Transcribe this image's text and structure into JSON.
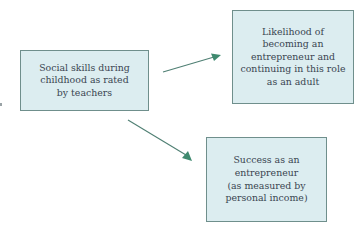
{
  "diagram": {
    "type": "causal-flow",
    "nodes": [
      {
        "id": "cause",
        "label": "Social skills during\nchildhood as rated\nby teachers"
      },
      {
        "id": "outcome-likelihood",
        "label": "Likelihood of\nbecoming an\nentrepreneur and\ncontinuing in this role\nas an adult"
      },
      {
        "id": "outcome-success",
        "label": "Success as an\nentrepreneur\n(as measured by\npersonal income)"
      }
    ],
    "edges": [
      {
        "from": "cause",
        "to": "outcome-likelihood"
      },
      {
        "from": "cause",
        "to": "outcome-success"
      }
    ],
    "colors": {
      "node_fill": "#dcedf0",
      "node_border": "#6f8f8c",
      "text": "#3a4550",
      "arrow_line": "#4f7f73",
      "arrow_head": "#3f8a6f"
    }
  }
}
